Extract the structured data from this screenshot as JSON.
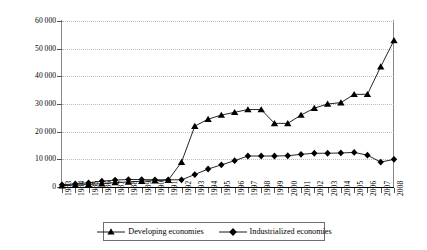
{
  "chart_data": {
    "type": "line",
    "title": "",
    "xlabel": "",
    "ylabel": "US$ million",
    "ylim": [
      0,
      60000
    ],
    "ytick_values": [
      0,
      10000,
      20000,
      30000,
      40000,
      50000,
      60000
    ],
    "ytick_labels": [
      "0",
      "10 000",
      "20 000",
      "30 000",
      "40 000",
      "50 000",
      "60 000"
    ],
    "grid": true,
    "legend_position": "bottom-center",
    "categories": [
      "1983",
      "1984",
      "1985",
      "1986",
      "1987",
      "1988",
      "1989",
      "1990",
      "1991",
      "1992",
      "1993",
      "1994",
      "1995",
      "1996",
      "1997",
      "1998",
      "1999",
      "2000",
      "2001",
      "2002",
      "2003",
      "2004",
      "2005",
      "2006",
      "2007",
      "2008"
    ],
    "series": [
      {
        "name": "Developing economies",
        "marker": "triangle",
        "color": "#000000",
        "values": [
          500,
          700,
          900,
          1200,
          1600,
          1800,
          2100,
          2300,
          2500,
          9000,
          22000,
          24500,
          26000,
          27000,
          28000,
          28000,
          23000,
          23000,
          26000,
          28500,
          30000,
          30500,
          33500,
          33500,
          43500,
          53000
        ]
      },
      {
        "name": "Industrialized economies",
        "marker": "diamond",
        "color": "#000000",
        "values": [
          800,
          1100,
          1500,
          2100,
          2500,
          2700,
          2700,
          2600,
          2600,
          2600,
          4500,
          6500,
          8000,
          9500,
          11200,
          11200,
          11200,
          11300,
          11800,
          12200,
          12200,
          12300,
          12500,
          11500,
          9000,
          10000
        ]
      }
    ]
  },
  "legend": {
    "entries": [
      {
        "label": "Developing economies"
      },
      {
        "label": "Industrialized economies"
      }
    ]
  }
}
